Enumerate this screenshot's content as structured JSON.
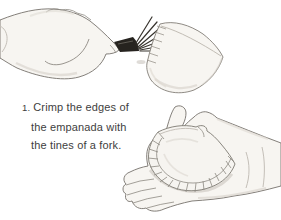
{
  "page": {
    "background": "#ffffff",
    "text_color": "#3e3e3e"
  },
  "caption": {
    "number": "1.",
    "lines": [
      "Crimp the edges of",
      "the empanada with",
      "the tines of a fork."
    ]
  },
  "illustrations": {
    "top": {
      "name": "hand-crimping-empanada-with-fork"
    },
    "bottom": {
      "name": "hand-holding-crimped-empanada"
    }
  },
  "colors": {
    "sketch_outline": "#76726c",
    "sketch_fill": "#f7f5f1",
    "fork_dark": "#26231f",
    "shading": "#d6d1ca"
  }
}
